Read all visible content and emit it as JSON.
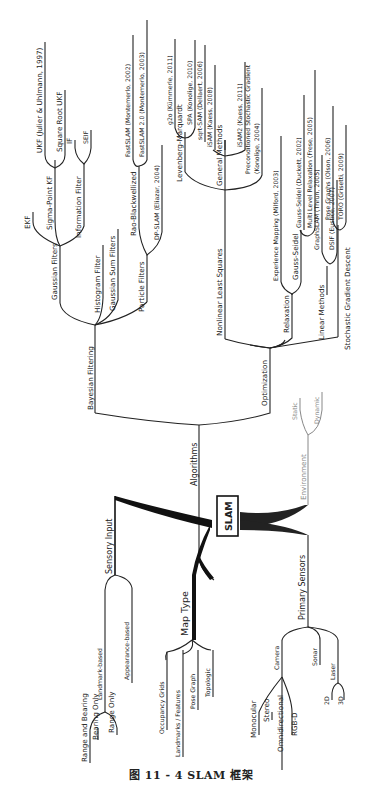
{
  "diagram": {
    "root": "SLAM",
    "branches": {
      "algorithms": {
        "label": "Algorithms",
        "bayesian": {
          "label": "Bayesian Filtering",
          "gaussian_filters": {
            "label": "Gaussian Filters",
            "ekf": "EKF",
            "sigma_point": {
              "label": "Sigma-Point KF",
              "ukf": "UKF (Julier & Uhlmann, 1997)",
              "sqrt_ukf": "Square Root UKF"
            },
            "information_filter": {
              "label": "Information Filter",
              "if": "IF",
              "seif": "SEIF"
            }
          },
          "histogram": "Histogram Filter",
          "gaussian_sum": "Gaussian Sum Filters",
          "particle_filters": {
            "label": "Particle Filters",
            "rao": {
              "label": "Rao-Blackwellized",
              "fastslam": "FastSLAM (Montemerlo, 2002)",
              "fastslam2": "FastSLAM 2.0 (Montemerlo, 2003)"
            },
            "dpslam": "DP-SLAM (Eliazar, 2004)"
          }
        },
        "optimization": {
          "label": "Optimization",
          "nls": {
            "label": "Nonlinear Least Squares",
            "lm": {
              "label": "Levenberg-Marquardt",
              "g2o": "g2o (Kümmerle, 2011)",
              "spa": "SPA (Konolige, 2010)"
            },
            "general": {
              "label": "General Methods",
              "sqrtsam": "sqrt-SAM (Dellaert, 2006)",
              "isam": "iSAM (Kaess, 2008)",
              "isam2": "iSAM2 (Kaess, 2011)"
            },
            "psgd_line1": "Preconditioned Stochastic Gradient",
            "psgd_line2": "(Konolige, 2004)"
          },
          "relaxation": {
            "label": "Relaxation",
            "exp_mapping": "Experience Mapping (Milford, 2003)",
            "gauss_seidel": {
              "label": "Gauss-Seidel",
              "gs_duckett": "Gauss-Seidel (Duckett, 2002)",
              "multilevel": "Multi Level Relaxation (Frese, 2005)"
            }
          },
          "linear": {
            "label": "Linear Methods",
            "graphslam": "GraphSLAM (Thrun, 2005)",
            "dsif": "DSIF (Eustice, 2007)"
          },
          "sgd": {
            "label": "Stochastic Gradient Descent",
            "pose_graphs": "Pose Graphs (Olson, 2006)",
            "toro": "TORO (Grisetti, 2009)"
          }
        }
      },
      "environment": {
        "label": "Environment",
        "static": "Static",
        "dynamic": "Dynamic"
      },
      "sensory_input": {
        "label": "Sensory Input",
        "landmark": {
          "label": "Landmark-based",
          "range_bearing": "Range and Bearing",
          "bearing_only": "Bearing Only",
          "range_only": "Range Only"
        },
        "appearance": "Appearance-based"
      },
      "map_type": {
        "label": "Map Type",
        "occupancy": "Occupancy Grids",
        "landmarks": "Landmarks / Features",
        "pose_graph": "Pose Graph",
        "topologic": "Topologic"
      },
      "primary_sensors": {
        "label": "Primary Sensors",
        "camera": {
          "label": "Camera",
          "monocular": "Monocular",
          "stereo": "Stereo",
          "omni": "Omnidirectional",
          "rgbd": "RGB-D"
        },
        "sonar": "Sonar",
        "laser": {
          "label": "Laser",
          "l2d": "2D",
          "l3d": "3D"
        }
      }
    }
  },
  "caption": "图 11 - 4    SLAM 框架"
}
